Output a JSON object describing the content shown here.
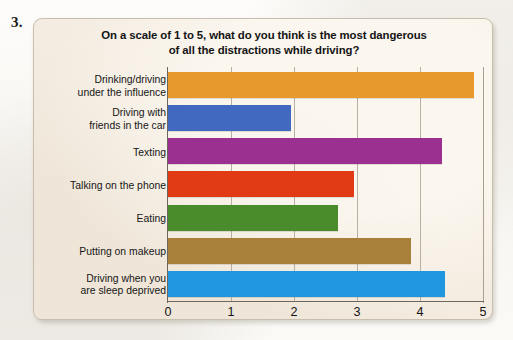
{
  "question_number": "3.",
  "chart_data": {
    "type": "bar",
    "orientation": "horizontal",
    "title": "On a scale of 1 to 5, what do you think is the most dangerous of all the distractions while driving?",
    "title_lines": [
      "On a scale of 1 to 5, what do you think is the most dangerous",
      "of all the distractions while driving?"
    ],
    "xlabel": "",
    "ylabel": "",
    "xlim": [
      0,
      5
    ],
    "xticks": [
      "0",
      "1",
      "2",
      "3",
      "4",
      "5"
    ],
    "grid": true,
    "legend": "none",
    "categories": [
      "Drinking/driving under the influence",
      "Driving with friends in the car",
      "Texting",
      "Talking on the phone",
      "Eating",
      "Putting on makeup",
      "Driving when you are sleep deprived"
    ],
    "category_lines": [
      [
        "Drinking/driving",
        "under the influence"
      ],
      [
        "Driving with",
        "friends in the car"
      ],
      [
        "Texting"
      ],
      [
        "Talking on the phone"
      ],
      [
        "Eating"
      ],
      [
        "Putting on makeup"
      ],
      [
        "Driving when you",
        "are sleep deprived"
      ]
    ],
    "values": [
      4.85,
      1.95,
      4.35,
      2.95,
      2.7,
      3.85,
      4.4
    ],
    "colors": [
      "#E8992E",
      "#4169C0",
      "#9B3090",
      "#E13B15",
      "#4A8B2C",
      "#A8803A",
      "#2196E0"
    ]
  },
  "palette": {
    "card_background": "#f4ece1",
    "card_border": "#c8bead",
    "axis": "#6d665c",
    "gridline": "#b9b0a2",
    "text": "#141414"
  }
}
